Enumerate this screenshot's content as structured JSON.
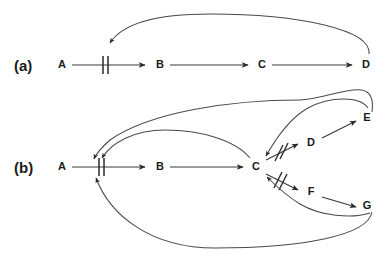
{
  "figure": {
    "background_color": "#ffffff",
    "line_color": "#3a3a3a",
    "text_color": "#1a1a1a",
    "width": 390,
    "height": 257
  },
  "panels": [
    {
      "id": "a",
      "label": "(a)",
      "nodes": [
        {
          "id": "a-A",
          "label": "A",
          "x": 62,
          "y": 65
        },
        {
          "id": "a-B",
          "label": "B",
          "x": 160,
          "y": 65
        },
        {
          "id": "a-C",
          "label": "C",
          "x": 262,
          "y": 65
        },
        {
          "id": "a-D",
          "label": "D",
          "x": 366,
          "y": 65
        }
      ],
      "edges": [
        {
          "id": "a-A-to-B",
          "from": "A",
          "to": "B",
          "kind": "activation-inhibited",
          "marker": "double-bar"
        },
        {
          "id": "a-B-to-C",
          "from": "B",
          "to": "C",
          "kind": "activation",
          "marker": "none"
        },
        {
          "id": "a-C-to-D",
          "from": "C",
          "to": "D",
          "kind": "activation",
          "marker": "none"
        },
        {
          "id": "a-D-to-A-feedback",
          "from": "D",
          "to": "A-B-link",
          "kind": "feedback-curve",
          "marker": "none"
        }
      ]
    },
    {
      "id": "b",
      "label": "(b)",
      "nodes": [
        {
          "id": "b-A",
          "label": "A",
          "x": 62,
          "y": 167
        },
        {
          "id": "b-B",
          "label": "B",
          "x": 160,
          "y": 167
        },
        {
          "id": "b-C",
          "label": "C",
          "x": 256,
          "y": 167
        },
        {
          "id": "b-D",
          "label": "D",
          "x": 311,
          "y": 143
        },
        {
          "id": "b-E",
          "label": "E",
          "x": 367,
          "y": 118
        },
        {
          "id": "b-F",
          "label": "F",
          "x": 311,
          "y": 192
        },
        {
          "id": "b-G",
          "label": "G",
          "x": 367,
          "y": 206
        }
      ],
      "edges": [
        {
          "id": "b-A-to-B",
          "from": "A",
          "to": "B",
          "kind": "activation-inhibited",
          "marker": "double-bar"
        },
        {
          "id": "b-B-to-C",
          "from": "B",
          "to": "C",
          "kind": "activation",
          "marker": "none"
        },
        {
          "id": "b-C-to-D",
          "from": "C",
          "to": "D",
          "kind": "activation-inhibited",
          "marker": "double-slash"
        },
        {
          "id": "b-D-to-C",
          "from": "D",
          "to": "C",
          "kind": "activation",
          "marker": "none"
        },
        {
          "id": "b-D-to-E",
          "from": "D",
          "to": "E",
          "kind": "activation",
          "marker": "none"
        },
        {
          "id": "b-C-to-F",
          "from": "C",
          "to": "F",
          "kind": "activation-inhibited",
          "marker": "double-slash"
        },
        {
          "id": "b-F-to-C",
          "from": "F",
          "to": "C",
          "kind": "activation",
          "marker": "none"
        },
        {
          "id": "b-F-to-G",
          "from": "F",
          "to": "G",
          "kind": "activation",
          "marker": "none"
        },
        {
          "id": "b-E-to-A-feedback",
          "from": "E",
          "to": "A-B-link",
          "kind": "feedback-curve",
          "marker": "none"
        },
        {
          "id": "b-C-to-A-feedback",
          "from": "C",
          "to": "A-B-link",
          "kind": "feedback-curve",
          "marker": "none"
        },
        {
          "id": "b-G-to-A-feedback",
          "from": "G",
          "to": "A-B-link",
          "kind": "feedback-curve",
          "marker": "none"
        },
        {
          "id": "b-G-to-C-feedback",
          "from": "G",
          "to": "C",
          "kind": "feedback-curve",
          "marker": "none"
        }
      ]
    }
  ]
}
